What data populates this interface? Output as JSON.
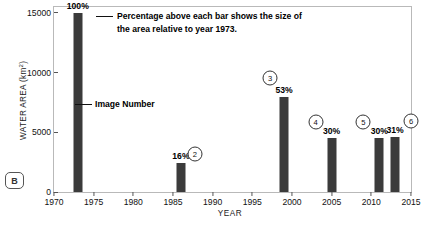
{
  "figure": {
    "panel_label": "B"
  },
  "chart_data": {
    "type": "bar",
    "title": "",
    "xlabel": "YEAR",
    "ylabel": "WATER AREA (km²)",
    "ylabel_main": "WATER AREA (km",
    "ylabel_sup": "2",
    "ylabel_close": ")",
    "xlim": [
      1970,
      2015
    ],
    "ylim": [
      0,
      15500
    ],
    "grid": false,
    "legend": null,
    "x_ticks": [
      1970,
      1975,
      1980,
      1985,
      1990,
      1995,
      2000,
      2005,
      2010,
      2015
    ],
    "y_ticks": [
      0,
      5000,
      10000,
      15000
    ],
    "x": [
      1973,
      1986,
      1999,
      2005,
      2011,
      2013
    ],
    "values": [
      15000,
      2400,
      8000,
      4550,
      4500,
      4650
    ],
    "percent_labels": [
      "100%",
      "16%",
      "53%",
      "30%",
      "30%",
      "31%"
    ],
    "image_numbers": [
      "1",
      "2",
      "3",
      "4",
      "5",
      "6"
    ],
    "bar_color": "#3b3b3b",
    "annotations": {
      "note_line1": "Percentage above each bar shows the size of",
      "note_line2": "the area relative to year 1973.",
      "image_number_label": "Image Number"
    }
  }
}
